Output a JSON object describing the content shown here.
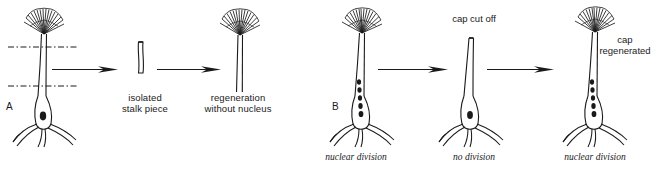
{
  "figure": {
    "background_color": "#ffffff",
    "ink_color": "#1a1a1a",
    "panels": [
      {
        "id": "A",
        "letter": "A",
        "steps": [
          {
            "name": "intact-alga-with-cut-lines",
            "organism": "intact alga with cap, stalk, rhizoid and one nucleus",
            "has_cap": true,
            "has_rhizoid": true,
            "nuclei": 1,
            "cut_lines": 2
          },
          {
            "name": "isolated-stalk",
            "caption": "isolated\nstalk piece",
            "caption_line1": "isolated",
            "caption_line2": "stalk piece",
            "has_cap": false,
            "has_rhizoid": false,
            "nuclei": 0
          },
          {
            "name": "regenerated-anucleate",
            "caption": "regeneration\nwithout nucleus",
            "caption_line1": "regeneration",
            "caption_line2": "without nucleus",
            "has_cap": true,
            "has_rhizoid": false,
            "nuclei": 0
          }
        ]
      },
      {
        "id": "B",
        "letter": "B",
        "steps": [
          {
            "name": "intact-alga-multinucleate",
            "caption": "nuclear division",
            "has_cap": true,
            "has_rhizoid": true,
            "nuclei": 5
          },
          {
            "name": "decapitated-alga",
            "top_label": "cap cut off",
            "caption": "no division",
            "has_cap": false,
            "has_rhizoid": true,
            "nuclei": 1
          },
          {
            "name": "cap-regenerated-alga",
            "top_label_line1": "cap",
            "top_label_line2": "regenerated",
            "caption": "nuclear division",
            "has_cap": true,
            "has_rhizoid": true,
            "nuclei": 5
          }
        ]
      }
    ],
    "arrows": 4
  }
}
